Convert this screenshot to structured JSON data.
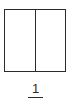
{
  "diagram": {
    "parts": [
      {
        "shaded": false
      },
      {
        "shaded": false
      }
    ],
    "label": "1",
    "colors": {
      "stroke": "#2b2b2b",
      "background": "#ffffff"
    }
  }
}
